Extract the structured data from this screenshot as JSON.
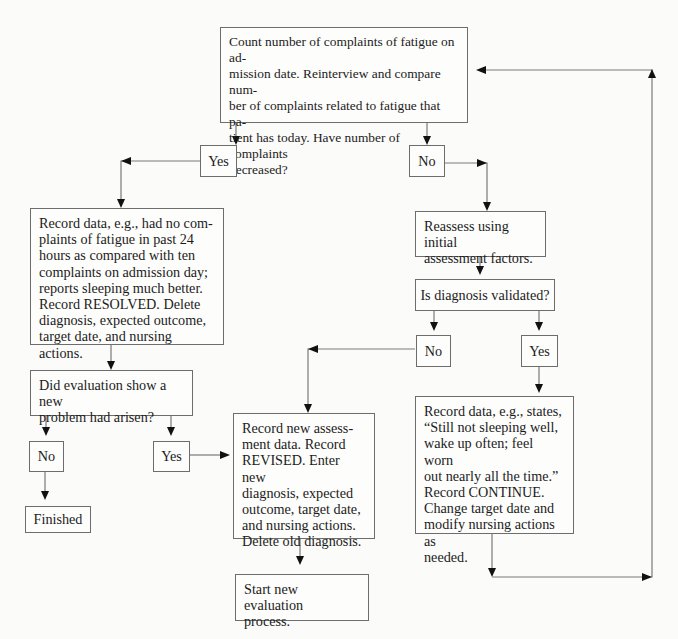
{
  "diagram": {
    "type": "flowchart",
    "nodes": {
      "start_question": "Count number of complaints of fatigue on admission date. Reinterview and compare number of complaints related to fatigue that patient has today. Have number of complaints decreased?",
      "start_question_lines": [
        "Count number of complaints of fatigue on ad-",
        "mission date. Reinterview and compare num-",
        "ber of complaints related to fatigue that pa-",
        "tient has today. Have number of complaints",
        "decreased?"
      ],
      "yes_1": "Yes",
      "no_1": "No",
      "resolved_record_lines": [
        "Record data, e.g., had no com-",
        "plaints of fatigue in past 24",
        "hours as compared with ten",
        "complaints on admission day;",
        "reports sleeping much better.",
        "Record RESOLVED. Delete",
        "diagnosis, expected outcome,",
        "target date, and nursing actions."
      ],
      "new_problem_question_lines": [
        "Did evaluation show a new",
        "problem had arisen?"
      ],
      "no_2": "No",
      "yes_2": "Yes",
      "finished": "Finished",
      "reassess_lines": [
        "Reassess using initial",
        "assessment factors."
      ],
      "diagnosis_validated": "Is diagnosis validated?",
      "no_3": "No",
      "yes_3": "Yes",
      "revised_record_lines": [
        "Record new assess-",
        "ment data. Record",
        "REVISED. Enter new",
        "diagnosis, expected",
        "outcome, target date,",
        "and nursing actions.",
        "Delete old diagnosis."
      ],
      "start_new_eval_lines": [
        "Start new evaluation",
        "process."
      ],
      "continue_record_lines": [
        "Record data, e.g., states,",
        "“Still not sleeping well,",
        "wake up often; feel worn",
        "out nearly all the time.”",
        "Record CONTINUE.",
        "Change target date and",
        "modify nursing actions as",
        "needed."
      ]
    },
    "colors": {
      "border": "#6d6d6d",
      "line": "#7a7a7a",
      "arrowhead": "#111111",
      "background": "#fbfbfa",
      "text": "#1b1b1b"
    }
  }
}
